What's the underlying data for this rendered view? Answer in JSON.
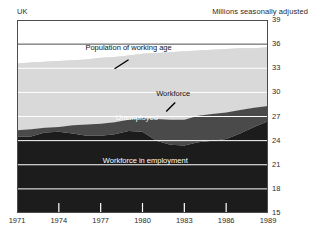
{
  "header": {
    "left": "UK",
    "right": "Millions seasonally adjusted"
  },
  "chart_data": {
    "type": "area",
    "title": "",
    "subtitle": "",
    "xlabel": "",
    "ylabel": "Millions seasonally adjusted",
    "region": "UK",
    "grid": true,
    "legend_position": "inline-annotations",
    "xlim": [
      1971,
      1989
    ],
    "ylim": [
      15,
      39
    ],
    "ytick_labels": [
      "39",
      "36",
      "33",
      "30",
      "27",
      "24",
      "21",
      "18",
      "15"
    ],
    "yticks": [
      39,
      36,
      33,
      30,
      27,
      24,
      21,
      18,
      15
    ],
    "xtick_labels": [
      "1971",
      "1974",
      "1977",
      "1980",
      "1983",
      "1986",
      "1989"
    ],
    "xticks": [
      1971,
      1974,
      1977,
      1980,
      1983,
      1986,
      1989
    ],
    "x": [
      1971,
      1972,
      1973,
      1974,
      1975,
      1976,
      1977,
      1978,
      1979,
      1980,
      1981,
      1982,
      1983,
      1984,
      1985,
      1986,
      1987,
      1988,
      1989
    ],
    "series": [
      {
        "name": "Population of working age",
        "fill": "#d9d9d9",
        "label_text": "Population of working age",
        "values": [
          33.6,
          33.7,
          33.8,
          33.9,
          34.0,
          34.1,
          34.3,
          34.4,
          34.6,
          34.8,
          34.9,
          35.0,
          35.1,
          35.2,
          35.3,
          35.4,
          35.5,
          35.5,
          35.6
        ]
      },
      {
        "name": "Workforce",
        "fill": "#a8a8a8",
        "label_text": "Workforce",
        "values": [
          25.3,
          25.4,
          25.6,
          25.7,
          25.9,
          26.0,
          26.1,
          26.3,
          26.6,
          26.8,
          26.7,
          26.6,
          26.6,
          27.1,
          27.3,
          27.5,
          27.8,
          28.1,
          28.3
        ]
      },
      {
        "name": "Unemployed",
        "fill": "#4a4a4a",
        "label_text": "Unemployed",
        "values": [
          0.8,
          0.9,
          0.6,
          0.6,
          1.0,
          1.4,
          1.5,
          1.5,
          1.4,
          1.7,
          2.7,
          3.1,
          3.2,
          3.3,
          3.3,
          3.3,
          2.9,
          2.4,
          1.9
        ]
      },
      {
        "name": "Workforce in employment",
        "fill": "#1c1c1c",
        "label_text": "Workforce in employment",
        "values": [
          24.5,
          24.5,
          25.0,
          25.1,
          24.9,
          24.6,
          24.6,
          24.8,
          25.2,
          25.1,
          24.0,
          23.5,
          23.4,
          23.8,
          24.0,
          24.2,
          24.9,
          25.7,
          26.4
        ]
      }
    ],
    "annotations": [
      {
        "text": "Population of working age",
        "x": 1979.0,
        "y": 35.3
      },
      {
        "text": "Workforce",
        "x": 1982.2,
        "y": 29.6
      },
      {
        "text": "Unemployed",
        "x": 1979.6,
        "y": 26.6
      },
      {
        "text": "Workforce in employment",
        "x": 1980.2,
        "y": 21.2
      }
    ],
    "colors": {
      "population_band": "#d9d9d9",
      "workforce_band": "#a8a8a8",
      "unemployed_band": "#4a4a4a",
      "employment_band": "#1c1c1c",
      "gridline": "#ffffff",
      "axis": "#4d4d4d",
      "background": "#ffffff"
    }
  }
}
